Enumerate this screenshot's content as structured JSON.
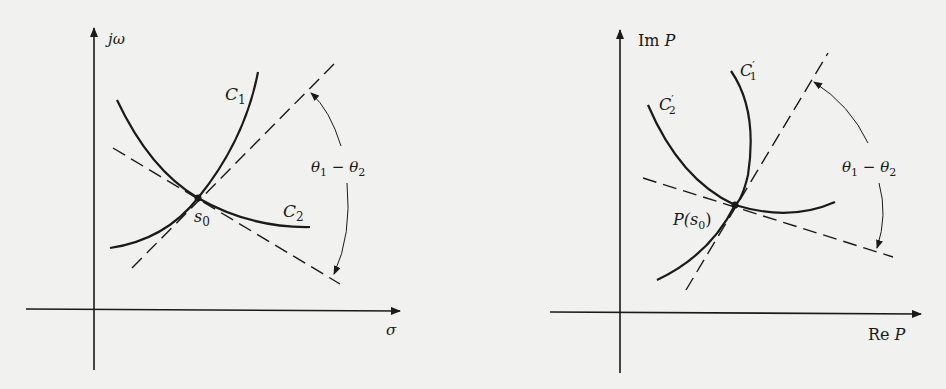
{
  "figure": {
    "left_panel": {
      "title": "s-plane",
      "y_axis_label": "jω",
      "x_axis_label": "σ",
      "curve_1_label": "C",
      "curve_1_sub": "1",
      "curve_2_label": "C",
      "curve_2_sub": "2",
      "point_label": "s",
      "point_sub": "0",
      "angle_label_theta1": "θ",
      "angle_sub1": "1",
      "angle_minus": " − ",
      "angle_label_theta2": "θ",
      "angle_sub2": "2"
    },
    "right_panel": {
      "title": "P-plane",
      "y_axis_label_prefix": "Im ",
      "y_axis_label_var": "P",
      "x_axis_label_prefix": "Re ",
      "x_axis_label_var": "P",
      "curve_1_label": "C",
      "curve_1_sub": "1",
      "curve_1_prime": "′",
      "curve_2_label": "C",
      "curve_2_sub": "2",
      "curve_2_prime": "′",
      "point_label_prefix": "P(",
      "point_label_var": "s",
      "point_sub": "0",
      "point_label_suffix": ")",
      "angle_label_theta1": "θ",
      "angle_sub1": "1",
      "angle_minus": " − ",
      "angle_label_theta2": "θ",
      "angle_sub2": "2"
    },
    "colors": {
      "background": "#f1f1ef",
      "ink": "#1a1a1a"
    }
  }
}
